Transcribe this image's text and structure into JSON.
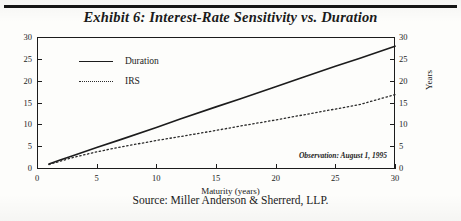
{
  "title": "Exhibit 6: Interest-Rate Sensitivity vs. Duration",
  "source": "Source: Miller Anderson & Sherrerd, LLP.",
  "annotation": "Observation: August 1, 1995",
  "chart_data": {
    "type": "line",
    "title": "Exhibit 6: Interest-Rate Sensitivity vs. Duration",
    "xlabel": "Maturity (years)",
    "ylabel": "Years",
    "ylabel_right": "Years",
    "xlim": [
      0,
      30
    ],
    "ylim": [
      0,
      30
    ],
    "xticks": [
      0,
      5,
      10,
      15,
      20,
      25,
      30
    ],
    "yticks": [
      0,
      5,
      10,
      15,
      20,
      25,
      30
    ],
    "yticks_right": [
      0,
      5,
      10,
      15,
      20,
      25,
      30
    ],
    "grid": false,
    "legend_position": "upper-left-inside",
    "annotation": "Observation: August 1, 1995",
    "x": [
      1,
      2,
      3,
      5,
      7,
      10,
      12,
      15,
      17,
      20,
      22,
      25,
      27,
      30
    ],
    "series": [
      {
        "name": "Duration",
        "style": "solid",
        "color": "#1c1c1c",
        "values": [
          0.9,
          1.9,
          2.8,
          4.7,
          6.5,
          9.3,
          11.2,
          14.0,
          15.8,
          18.6,
          20.5,
          23.3,
          25.1,
          27.9
        ]
      },
      {
        "name": "IRS",
        "style": "dotted",
        "color": "#2a2a2a",
        "values": [
          0.8,
          1.6,
          2.4,
          3.7,
          4.8,
          6.3,
          7.2,
          8.6,
          9.6,
          11.0,
          12.0,
          13.5,
          14.5,
          16.8
        ]
      }
    ]
  },
  "axes": {
    "x_title": "Maturity (years)",
    "y_title_left": "Years",
    "y_title_right": "Years",
    "x_ticklabels": [
      "0",
      "5",
      "10",
      "15",
      "20",
      "25",
      "30"
    ],
    "y_ticklabels_left": [
      "0",
      "5",
      "10",
      "15",
      "20",
      "25",
      "30"
    ],
    "y_ticklabels_right": [
      "0",
      "5",
      "10",
      "15",
      "20",
      "25",
      "30"
    ]
  },
  "legend": {
    "items": [
      {
        "label": "Duration"
      },
      {
        "label": "IRS"
      }
    ]
  }
}
